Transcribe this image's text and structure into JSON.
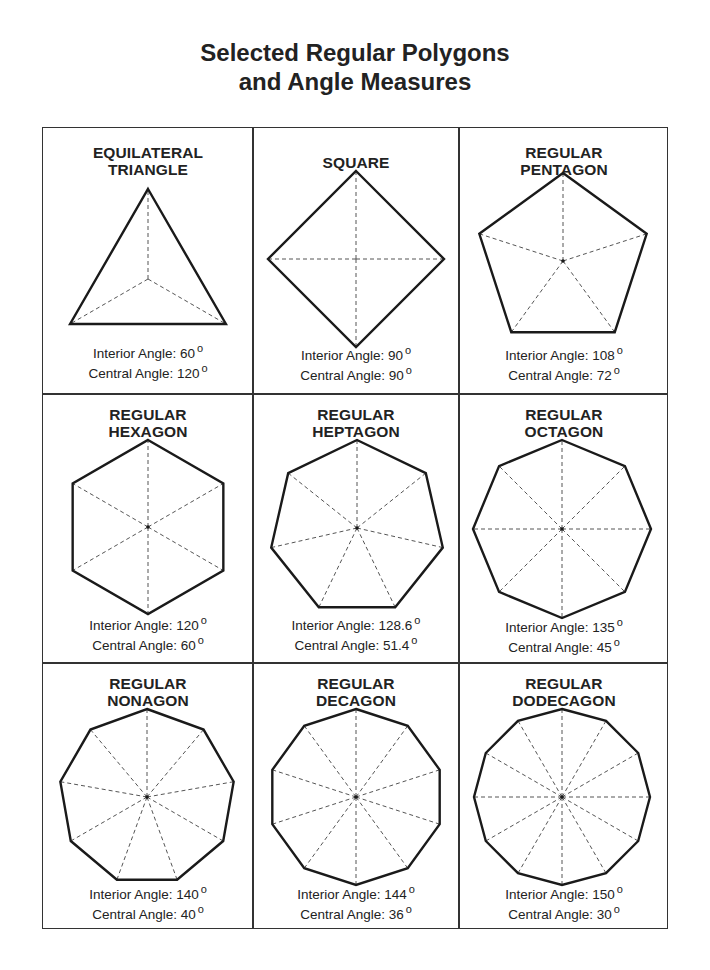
{
  "title": {
    "line1": "Selected Regular Polygons",
    "line2": "and Angle Measures"
  },
  "labels": {
    "interior_prefix": "Interior Angle: ",
    "central_prefix": "Central Angle: ",
    "degree_symbol": "o"
  },
  "polygons": [
    {
      "name_line1": "EQUILATERAL",
      "name_line2": "TRIANGLE",
      "sides": 3,
      "interior": "60",
      "central": "120"
    },
    {
      "name_line1": "SQUARE",
      "name_line2": "",
      "sides": 4,
      "interior": "90",
      "central": "90"
    },
    {
      "name_line1": "REGULAR",
      "name_line2": "PENTAGON",
      "sides": 5,
      "interior": "108",
      "central": "72"
    },
    {
      "name_line1": "REGULAR",
      "name_line2": "HEXAGON",
      "sides": 6,
      "interior": "120",
      "central": "60"
    },
    {
      "name_line1": "REGULAR",
      "name_line2": "HEPTAGON",
      "sides": 7,
      "interior": "128.6",
      "central": "51.4"
    },
    {
      "name_line1": "REGULAR",
      "name_line2": "OCTAGON",
      "sides": 8,
      "interior": "135",
      "central": "45"
    },
    {
      "name_line1": "REGULAR",
      "name_line2": "NONAGON",
      "sides": 9,
      "interior": "140",
      "central": "40"
    },
    {
      "name_line1": "REGULAR",
      "name_line2": "DECAGON",
      "sides": 10,
      "interior": "144",
      "central": "36"
    },
    {
      "name_line1": "REGULAR",
      "name_line2": "DODECAGON",
      "sides": 12,
      "interior": "150",
      "central": "30"
    }
  ],
  "colors": {
    "stroke": "#1a1a1a",
    "dash": "#555555",
    "border": "#333333"
  }
}
